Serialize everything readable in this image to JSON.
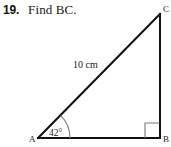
{
  "problem": {
    "number": "19.",
    "instruction": "Find BC."
  },
  "figure": {
    "type": "right-triangle",
    "vertices": [
      {
        "name": "A",
        "label": "A",
        "x": 38,
        "y": 138
      },
      {
        "name": "B",
        "label": "B",
        "x": 160,
        "y": 138
      },
      {
        "name": "C",
        "label": "C",
        "x": 160,
        "y": 14
      }
    ],
    "labels": {
      "vertex_a": "A",
      "vertex_b": "B",
      "vertex_c": "C",
      "hypotenuse": "10 cm",
      "angle_a": "42°"
    },
    "measures": {
      "angle_a_degrees": 42,
      "angle_b_degrees": 90,
      "hypotenuse_length": "10 cm",
      "unknown_side": "BC"
    },
    "marks": {
      "right_angle_at": "B",
      "arc_at": "A"
    },
    "colors": {
      "line": "#111111",
      "mark": "#777777",
      "text": "#1a1a1a",
      "background": "#ffffff"
    }
  }
}
